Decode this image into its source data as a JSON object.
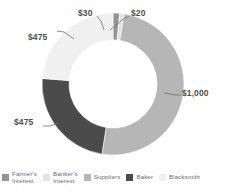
{
  "chart_data": {
    "type": "pie",
    "variant": "donut",
    "title": "",
    "subtitle": "",
    "xlabel": "",
    "ylabel": "",
    "currency": "$",
    "total": 2000,
    "grid": false,
    "legend_position": "bottom",
    "start_angle_deg": 0,
    "direction": "clockwise",
    "inner_radius_ratio": 0.62,
    "categories": [
      "Farmer's Interest",
      "Banker's Interest",
      "Suppliers",
      "Baker",
      "Blacksmith"
    ],
    "values": [
      30,
      20,
      1000,
      475,
      475
    ],
    "value_labels": [
      "$30",
      "$20",
      "$1,000",
      "$475",
      "$475"
    ],
    "colors": [
      "#939393",
      "#e2e2e2",
      "#b6b6b6",
      "#4b4b4b",
      "#f0f0f0"
    ],
    "slices": [
      {
        "name": "Farmer's Interest",
        "value": 30,
        "label": "$30",
        "color": "#939393",
        "percent": 1.5
      },
      {
        "name": "Banker's Interest",
        "value": 20,
        "label": "$20",
        "color": "#e2e2e2",
        "percent": 1.0
      },
      {
        "name": "Suppliers",
        "value": 1000,
        "label": "$1,000",
        "color": "#b6b6b6",
        "percent": 50.0
      },
      {
        "name": "Baker",
        "value": 475,
        "label": "$475",
        "color": "#4b4b4b",
        "percent": 23.75
      },
      {
        "name": "Blacksmith",
        "value": 475,
        "label": "$475",
        "color": "#f0f0f0",
        "percent": 23.75
      }
    ]
  },
  "labels": {
    "farmers_interest": "$30",
    "bankers_interest": "$20",
    "suppliers": "$1,000",
    "baker": "$475",
    "blacksmith": "$475"
  },
  "legend": {
    "items": [
      {
        "label": "Farmer's\nInterest",
        "color": "#939393",
        "two_line": true
      },
      {
        "label": "Banker's\nInterest",
        "color": "#e2e2e2",
        "two_line": true
      },
      {
        "label": "Suppliers",
        "color": "#b6b6b6",
        "two_line": false
      },
      {
        "label": "Baker",
        "color": "#4b4b4b",
        "two_line": false
      },
      {
        "label": "Blacksmith",
        "color": "#f0f0f0",
        "two_line": false
      }
    ]
  }
}
